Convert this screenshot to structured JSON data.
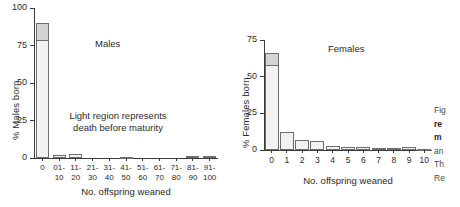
{
  "figure": {
    "caption_fragment_lines": [
      "Fig",
      "re",
      "m",
      "an",
      "Th",
      "Re"
    ]
  },
  "chart_data": [
    {
      "type": "bar",
      "title": "Males",
      "xlabel": "No. offspring weaned",
      "ylabel": "% Males born",
      "categories": [
        "0",
        "01-\n10",
        "11-\n20",
        "21-\n30",
        "31-\n40",
        "41-\n50",
        "51-\n60",
        "61-\n70",
        "71-\n80",
        "81-\n90",
        "91-\n100"
      ],
      "values": [
        90,
        2,
        3,
        0,
        0,
        1,
        0,
        0,
        0,
        1.2,
        1.2
      ],
      "series": [
        {
          "name": "Survived to maturity (light region lower)",
          "values": [
            79,
            2,
            3,
            0,
            0,
            1,
            0,
            0,
            0,
            1.2,
            1.2
          ]
        },
        {
          "name": "Died before maturity (dark cap)",
          "values": [
            11,
            0,
            0,
            0,
            0,
            0,
            0,
            0,
            0,
            0,
            0
          ]
        }
      ],
      "ylim": [
        0,
        100
      ],
      "yticks": [
        0,
        25,
        50,
        75,
        100
      ],
      "ytick_labels": [
        "0",
        "25",
        "50",
        "75",
        "100"
      ],
      "grid": false,
      "legend": "none",
      "annotation": "Light region represents\ndeath before maturity"
    },
    {
      "type": "bar",
      "title": "Females",
      "xlabel": "No. offspring weaned",
      "ylabel": "% Females born",
      "categories": [
        "0",
        "1",
        "2",
        "3",
        "4",
        "5",
        "6",
        "7",
        "8",
        "9",
        "10"
      ],
      "values": [
        66,
        12,
        7,
        6,
        3,
        2.2,
        1.8,
        1.6,
        1.2,
        2.0,
        0.7
      ],
      "series": [
        {
          "name": "Survived to maturity (light region lower)",
          "values": [
            58,
            12,
            7,
            6,
            3,
            2.2,
            1.8,
            1.6,
            1.2,
            2.0,
            0.7
          ]
        },
        {
          "name": "Died before maturity (dark cap)",
          "values": [
            8,
            0,
            0,
            0,
            0,
            0,
            0,
            0,
            0,
            0,
            0
          ]
        }
      ],
      "ylim": [
        0,
        75
      ],
      "yticks": [
        0,
        25,
        50,
        75
      ],
      "ytick_labels": [
        "0",
        "25",
        "50",
        "75"
      ],
      "grid": false,
      "legend": "none",
      "annotation": ""
    }
  ]
}
